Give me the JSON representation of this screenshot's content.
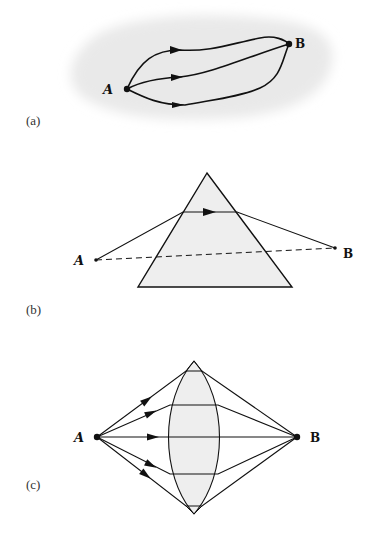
{
  "figure": {
    "panels": [
      {
        "id": "a",
        "label": "(a)",
        "description": "Multiple curved paths from A to B",
        "point_a": "A",
        "point_b": "B",
        "path_count": 3
      },
      {
        "id": "b",
        "label": "(b)",
        "description": "Ray refracted through a prism from A to B; dashed straight line A to B",
        "point_a": "A",
        "point_b": "B"
      },
      {
        "id": "c",
        "label": "(c)",
        "description": "Rays from A focused by a convex lens to B",
        "point_a": "A",
        "point_b": "B",
        "ray_count": 5
      }
    ],
    "colors": {
      "line": "#111111",
      "fill_shape": "#eeeeee",
      "smudge": "#e8e8e8"
    }
  }
}
